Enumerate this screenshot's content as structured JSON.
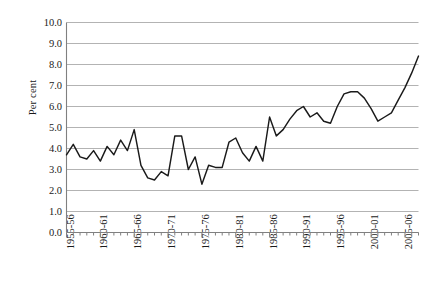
{
  "chart_data": {
    "type": "line",
    "title": "",
    "subtitle": "",
    "xlabel": "",
    "ylabel": "Per cent",
    "ylim": [
      0.0,
      10.0
    ],
    "ytick_step": 1.0,
    "ytick_labels": [
      "10.0",
      "9.0",
      "8.0",
      "7.0",
      "6.0",
      "5.0",
      "4.0",
      "3.0",
      "2.0",
      "1.0",
      "0.0"
    ],
    "ytick_values": [
      10.0,
      9.0,
      8.0,
      7.0,
      6.0,
      5.0,
      4.0,
      3.0,
      2.0,
      1.0,
      0.0
    ],
    "xtick_labels": [
      "1955-56",
      "1960-61",
      "1965-66",
      "1970-71",
      "1975-76",
      "1980-81",
      "1985-86",
      "1990-91",
      "1995-96",
      "2000-01",
      "2005-06"
    ],
    "xtick_label_indices": [
      0,
      5,
      10,
      15,
      20,
      25,
      30,
      35,
      40,
      45,
      50
    ],
    "minor_ticks_every_year": true,
    "grid": "horizontal",
    "legend": "none",
    "line_color": "#1a1a1a",
    "grid_color": "#b3b3b3",
    "axis_color": "#808080",
    "categories": [
      "1955-56",
      "1956-57",
      "1957-58",
      "1958-59",
      "1959-60",
      "1960-61",
      "1961-62",
      "1962-63",
      "1963-64",
      "1964-65",
      "1965-66",
      "1966-67",
      "1967-68",
      "1968-69",
      "1969-70",
      "1970-71",
      "1971-72",
      "1972-73",
      "1973-74",
      "1974-75",
      "1975-76",
      "1976-77",
      "1977-78",
      "1978-79",
      "1979-80",
      "1980-81",
      "1981-82",
      "1982-83",
      "1983-84",
      "1984-85",
      "1985-86",
      "1986-87",
      "1987-88",
      "1988-89",
      "1989-90",
      "1990-91",
      "1991-92",
      "1992-93",
      "1993-94",
      "1994-95",
      "1995-96",
      "1996-97",
      "1997-98",
      "1998-99",
      "1999-00",
      "2000-01",
      "2001-02",
      "2002-03",
      "2003-04",
      "2004-05",
      "2005-06",
      "2006-07",
      "2007-08"
    ],
    "values": [
      3.7,
      4.2,
      3.6,
      3.5,
      3.9,
      3.4,
      4.1,
      3.7,
      4.4,
      3.9,
      4.9,
      3.2,
      2.6,
      2.5,
      2.9,
      2.7,
      4.6,
      4.6,
      3.0,
      3.6,
      2.3,
      3.2,
      3.1,
      3.1,
      4.3,
      4.5,
      3.8,
      3.4,
      4.1,
      3.4,
      5.5,
      4.6,
      4.9,
      5.4,
      5.8,
      6.0,
      5.5,
      5.7,
      5.3,
      5.2,
      6.0,
      6.6,
      6.7,
      6.7,
      6.4,
      5.9,
      5.3,
      5.5,
      5.7,
      6.3,
      6.9,
      7.6,
      8.4
    ],
    "series_name": "Per cent"
  }
}
